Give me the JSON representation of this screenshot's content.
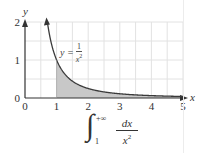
{
  "chart_data": {
    "type": "area",
    "title": "",
    "function": "y = 1/x^2",
    "xlabel": "x",
    "ylabel": "y",
    "xlim": [
      0,
      5
    ],
    "ylim": [
      0,
      2
    ],
    "x_ticks": [
      "0",
      "1",
      "2",
      "3",
      "4",
      "5"
    ],
    "y_ticks": [
      "0",
      "1",
      "2"
    ],
    "grid": true,
    "grid_step": 0.5,
    "shaded_region": {
      "from": 1,
      "to": 5,
      "under": "y = 1/x^2"
    },
    "series": [
      {
        "name": "y = 1/x^2",
        "x": [
          0.71,
          0.8,
          1,
          1.25,
          1.5,
          2,
          2.5,
          3,
          3.5,
          4,
          4.5,
          5
        ],
        "values": [
          2.0,
          1.5625,
          1.0,
          0.64,
          0.444,
          0.25,
          0.16,
          0.111,
          0.082,
          0.0625,
          0.049,
          0.04
        ]
      }
    ],
    "annotations": [
      {
        "text": "y = 1/x^2",
        "position": "near curve at x≈1.3, y≈1.2"
      }
    ],
    "caption": "∫_1^{+∞} dx / x^2"
  },
  "labels": {
    "x_axis": "x",
    "y_axis": "y",
    "curve_y": "y =",
    "curve_num": "1",
    "curve_den": "x",
    "curve_exp": "2"
  },
  "formula": {
    "integral_sign": "∫",
    "upper_limit": "+∞",
    "lower_limit": "1",
    "numerator": "dx",
    "denominator_base": "x",
    "denominator_exp": "2"
  },
  "colors": {
    "curve": "#3a3a3a",
    "shade": "#c8c8c8",
    "grid": "#e2e2e2",
    "axis": "#333333"
  }
}
